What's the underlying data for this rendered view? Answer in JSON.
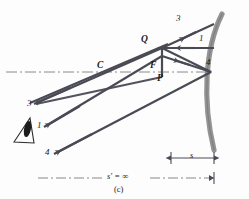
{
  "figure": {
    "caption": "(c)",
    "colors": {
      "ray": "#4a4a55",
      "mirror": "#8d8d8d",
      "axis": "#7a7a7a",
      "text": "#1b1b1b",
      "background": "#fdfdfd"
    },
    "points": [
      {
        "id": "C",
        "label": "C",
        "x": 100,
        "y": 66
      },
      {
        "id": "F",
        "label": "F",
        "x": 152,
        "y": 66
      },
      {
        "id": "Q",
        "label": "Q",
        "x": 142,
        "y": 40
      },
      {
        "id": "P",
        "label": "P",
        "x": 156,
        "y": 79
      }
    ],
    "ray_labels_mirror_side": [
      {
        "label": "3",
        "x": 176,
        "y": 14
      },
      {
        "label": "1",
        "x": 199,
        "y": 36
      },
      {
        "label": "4",
        "x": 207,
        "y": 60
      }
    ],
    "ray_labels_exit_side": [
      {
        "label": "3",
        "x": 28,
        "y": 99
      },
      {
        "label": "1",
        "x": 37,
        "y": 121
      },
      {
        "label": "4",
        "x": 46,
        "y": 147
      }
    ],
    "dimensions": [
      {
        "id": "object-distance",
        "label": "s",
        "x": 190,
        "y": 150
      },
      {
        "id": "image-distance",
        "label": "s′ = ∞",
        "x": 112,
        "y": 170
      }
    ],
    "icons": {
      "eye": "eye-icon",
      "mirror": "concave-mirror-arc",
      "axis": "optical-axis-dash-dot"
    }
  }
}
